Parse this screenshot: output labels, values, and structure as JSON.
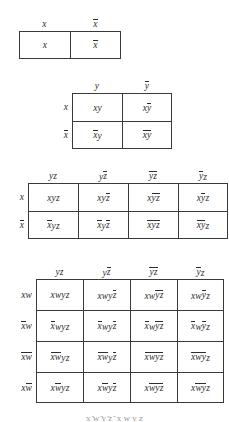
{
  "figure": {
    "background_color": "#ffffff",
    "line_color": "#3a3a3a",
    "text_color": "#2d2d2d",
    "caption_clipped": "x ̄w ̄y ̄z ̄ x w y z"
  },
  "maps": [
    {
      "id": "one-variable",
      "variables": 1,
      "column_headers": [
        "x",
        "x̄"
      ],
      "row_labels": [],
      "rows": [
        {
          "cells": [
            "x",
            "x̄"
          ]
        }
      ]
    },
    {
      "id": "two-variable",
      "variables": 2,
      "column_headers": [
        "y",
        "ȳ"
      ],
      "row_labels": [
        "x",
        "x̄"
      ],
      "rows": [
        {
          "label": "x",
          "cells": [
            "xy",
            "xȳ"
          ]
        },
        {
          "label": "x̄",
          "cells": [
            "x̄y",
            "x̄ȳ"
          ]
        }
      ]
    },
    {
      "id": "three-variable",
      "variables": 3,
      "column_headers": [
        "yz",
        "yz̄",
        "ȳz̄",
        "ȳz"
      ],
      "row_labels": [
        "x",
        "x̄"
      ],
      "rows": [
        {
          "label": "x",
          "cells": [
            "xyz",
            "xyz̄",
            "xȳz̄",
            "xȳz"
          ]
        },
        {
          "label": "x̄",
          "cells": [
            "x̄yz",
            "x̄yz̄",
            "x̄ȳz̄",
            "x̄ȳz"
          ]
        }
      ]
    },
    {
      "id": "four-variable",
      "variables": 4,
      "column_headers": [
        "yz",
        "yz̄",
        "ȳz̄",
        "ȳz"
      ],
      "row_labels": [
        "xw",
        "x̄w",
        "x̄w̄",
        "xw̄"
      ],
      "rows": [
        {
          "label": "xw",
          "cells": [
            "xwyz",
            "xwyz̄",
            "xwȳz̄",
            "xwȳz"
          ]
        },
        {
          "label": "x̄w",
          "cells": [
            "x̄wyz",
            "x̄wyz̄",
            "x̄wȳz̄",
            "x̄wȳz"
          ]
        },
        {
          "label": "x̄w̄",
          "cells": [
            "x̄w̄yz",
            "x̄w̄yz̄",
            "x̄w̄ȳz̄",
            "x̄w̄ȳz"
          ]
        },
        {
          "label": "xw̄",
          "cells": [
            "xw̄yz",
            "xw̄yz̄",
            "xw̄ȳz̄",
            "xw̄ȳz"
          ]
        }
      ]
    }
  ]
}
